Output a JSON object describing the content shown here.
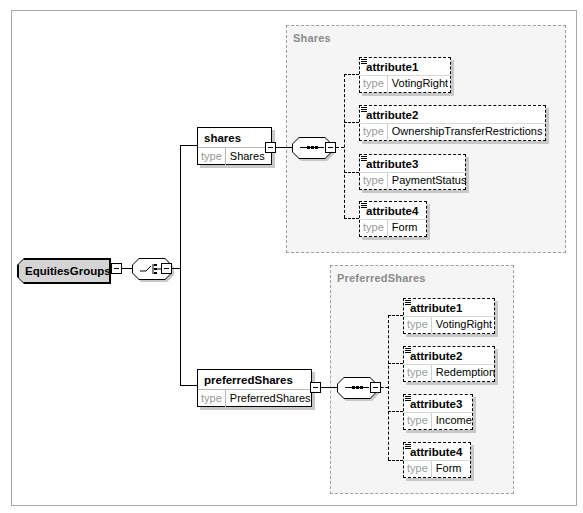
{
  "root": {
    "name": "EquitiesGroups",
    "compositor": "choice"
  },
  "elements": [
    {
      "name": "shares",
      "type_label": "type",
      "type": "Shares",
      "compositor": "sequence",
      "group_title": "Shares",
      "attributes": [
        {
          "name": "attribute1",
          "type_label": "type",
          "type": "VotingRight"
        },
        {
          "name": "attribute2",
          "type_label": "type",
          "type": "OwnershipTransferRestrictions"
        },
        {
          "name": "attribute3",
          "type_label": "type",
          "type": "PaymentStatus"
        },
        {
          "name": "attribute4",
          "type_label": "type",
          "type": "Form"
        }
      ]
    },
    {
      "name": "preferredShares",
      "type_label": "type",
      "type": "PreferredShares",
      "compositor": "sequence",
      "group_title": "PreferredShares",
      "attributes": [
        {
          "name": "attribute1",
          "type_label": "type",
          "type": "VotingRight"
        },
        {
          "name": "attribute2",
          "type_label": "type",
          "type": "Redemption"
        },
        {
          "name": "attribute3",
          "type_label": "type",
          "type": "Income"
        },
        {
          "name": "attribute4",
          "type_label": "type",
          "type": "Form"
        }
      ]
    }
  ],
  "colors": {
    "group_bg": "#f5f5f5",
    "root_bg": "#d4d4d4",
    "group_title": "#8a8a8a",
    "shadow": "#c8c8c8"
  }
}
